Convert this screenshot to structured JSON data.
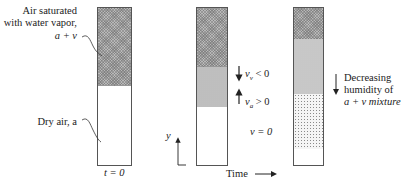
{
  "figure": {
    "left_panel": {
      "label_saturated": [
        "Air saturated",
        "with water vapor,",
        "a + v"
      ],
      "label_dry": "Dry air, a",
      "time_label": "t = 0"
    },
    "middle_panel": {
      "vv_label": "v",
      "vv_sub": "v",
      "vv_rel": " < 0",
      "va_label": "v",
      "va_sub": "a",
      "va_rel": " > 0",
      "v_zero": "v = 0",
      "axis_label": "y",
      "time_label": "Time"
    },
    "right_panel": {
      "label": [
        "Decreasing",
        "humidity of",
        "a + v mixture"
      ]
    },
    "colors": {
      "stroke": "#555555",
      "dark_fill": "#b9b9b9",
      "text": "#222222"
    }
  }
}
